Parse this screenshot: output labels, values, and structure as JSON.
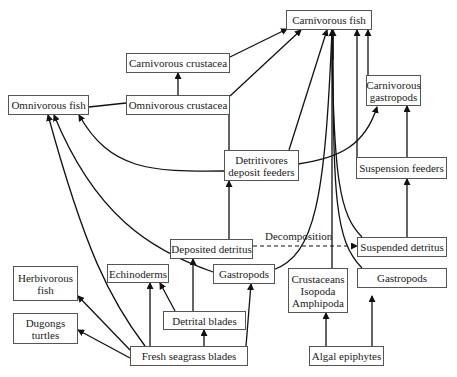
{
  "diagram": {
    "type": "food-web",
    "nodes": {
      "carnivorous_fish": "Carnivorous fish",
      "carnivorous_crustacea": "Carnivorous crustacea",
      "omnivorous_fish": "Omnivorous fish",
      "omnivorous_crustacea": "Omnivorous crustacea",
      "carnivorous_gastropods": "Carnivorous\ngastropods",
      "detritivores": "Detritivores\ndeposit feeders",
      "suspension_feeders": "Suspension feeders",
      "deposited_detritus": "Deposited detritus",
      "suspended_detritus": "Suspended detritus",
      "gastropods_left": "Gastropods",
      "crustaceans": "Crustaceans\nIsopoda\nAmphipoda",
      "gastropods_right": "Gastropods",
      "echinoderms": "Echinoderms",
      "herbivorous_fish": "Herbivorous\nfish",
      "dugongs_turtles": "Dugongs\nturtles",
      "detrital_blades": "Detrital blades",
      "fresh_seagrass": "Fresh seagrass blades",
      "algal_epiphytes": "Algal epiphytes"
    },
    "edge_labels": {
      "decomposition": "Decomposition"
    },
    "edges": [
      {
        "from": "omnivorous_crustacea",
        "to": "carnivorous_crustacea"
      },
      {
        "from": "omnivorous_crustacea",
        "to": "omnivorous_fish",
        "style": "line"
      },
      {
        "from": "carnivorous_crustacea",
        "to": "carnivorous_fish"
      },
      {
        "from": "omnivorous_crustacea",
        "to": "carnivorous_fish"
      },
      {
        "from": "detritivores",
        "to": "carnivorous_fish"
      },
      {
        "from": "detritivores",
        "to": "omnivorous_fish"
      },
      {
        "from": "detritivores",
        "to": "carnivorous_gastropods"
      },
      {
        "from": "detritivores",
        "to": "omnivorous_crustacea",
        "style": "line"
      },
      {
        "from": "suspension_feeders",
        "to": "carnivorous_gastropods"
      },
      {
        "from": "suspension_feeders",
        "to": "carnivorous_fish"
      },
      {
        "from": "carnivorous_gastropods",
        "to": "carnivorous_fish"
      },
      {
        "from": "suspended_detritus",
        "to": "suspension_feeders"
      },
      {
        "from": "deposited_detritus",
        "to": "detritivores"
      },
      {
        "from": "deposited_detritus",
        "to": "suspended_detritus",
        "style": "dashed",
        "label": "Decomposition"
      },
      {
        "from": "gastropods_left",
        "to": "carnivorous_fish"
      },
      {
        "from": "crustaceans",
        "to": "carnivorous_fish"
      },
      {
        "from": "gastropods_right",
        "to": "carnivorous_fish"
      },
      {
        "from": "suspended_detritus",
        "to": "carnivorous_fish"
      },
      {
        "from": "gastropods_left",
        "to": "omnivorous_fish"
      },
      {
        "from": "fresh_seagrass",
        "to": "omnivorous_fish"
      },
      {
        "from": "fresh_seagrass",
        "to": "herbivorous_fish"
      },
      {
        "from": "fresh_seagrass",
        "to": "dugongs_turtles"
      },
      {
        "from": "fresh_seagrass",
        "to": "echinoderms"
      },
      {
        "from": "detrital_blades",
        "to": "echinoderms"
      },
      {
        "from": "detrital_blades",
        "to": "deposited_detritus"
      },
      {
        "from": "fresh_seagrass",
        "to": "detrital_blades"
      },
      {
        "from": "fresh_seagrass",
        "to": "gastropods_left"
      },
      {
        "from": "algal_epiphytes",
        "to": "crustaceans"
      },
      {
        "from": "algal_epiphytes",
        "to": "gastropods_right"
      }
    ]
  }
}
